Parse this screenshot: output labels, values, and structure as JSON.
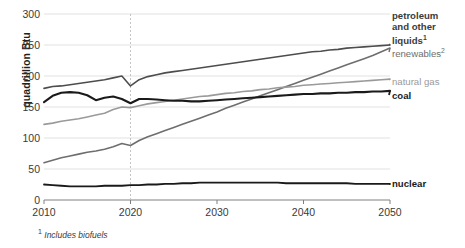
{
  "chart_data": {
    "type": "line",
    "title": "",
    "xlabel": "",
    "ylabel": "quadrillion Btu",
    "xlim": [
      2010,
      2050
    ],
    "ylim": [
      0,
      300
    ],
    "yticks": [
      0,
      50,
      100,
      150,
      200,
      250,
      300
    ],
    "xticks": [
      2010,
      2020,
      2030,
      2040,
      2050
    ],
    "grid": "horizontal",
    "legend_position": "right-inline-labels",
    "projection_divider_year": 2020,
    "footnote": "Includes biofuels",
    "footnote_marker": "1",
    "x": [
      2010,
      2011,
      2012,
      2013,
      2014,
      2015,
      2016,
      2017,
      2018,
      2019,
      2020,
      2021,
      2022,
      2023,
      2024,
      2025,
      2026,
      2027,
      2028,
      2029,
      2030,
      2031,
      2032,
      2033,
      2034,
      2035,
      2036,
      2037,
      2038,
      2039,
      2040,
      2041,
      2042,
      2043,
      2044,
      2045,
      2046,
      2047,
      2048,
      2049,
      2050
    ],
    "series": [
      {
        "name": "petroleum and other liquids",
        "label": "petroleum and other liquids",
        "label_marker": "1",
        "color": "#4d4d4d",
        "width": 1.6,
        "values": [
          180,
          183,
          184,
          186,
          188,
          190,
          192,
          194,
          197,
          200,
          184,
          194,
          199,
          202,
          205,
          207,
          209,
          211,
          213,
          215,
          217,
          219,
          221,
          223,
          225,
          227,
          229,
          231,
          233,
          235,
          237,
          239,
          240,
          242,
          243,
          245,
          246,
          247,
          248,
          249,
          250
        ]
      },
      {
        "name": "renewables",
        "label": "renewables",
        "label_marker": "2",
        "color": "#6e6e6e",
        "width": 1.6,
        "values": [
          60,
          64,
          68,
          71,
          74,
          77,
          79,
          82,
          86,
          91,
          88,
          96,
          102,
          107,
          112,
          117,
          122,
          127,
          132,
          137,
          142,
          148,
          153,
          158,
          163,
          168,
          173,
          178,
          183,
          188,
          193,
          198,
          203,
          208,
          213,
          218,
          223,
          228,
          233,
          239,
          245
        ]
      },
      {
        "name": "natural gas",
        "label": "natural gas",
        "color": "#9a9a9a",
        "width": 1.6,
        "values": [
          122,
          124,
          127,
          129,
          131,
          134,
          137,
          140,
          146,
          150,
          149,
          152,
          155,
          157,
          159,
          161,
          163,
          165,
          167,
          168,
          170,
          172,
          173,
          175,
          176,
          178,
          179,
          181,
          182,
          183,
          185,
          186,
          187,
          188,
          189,
          190,
          191,
          192,
          193,
          194,
          195
        ]
      },
      {
        "name": "coal",
        "label": "coal",
        "color": "#1a1a1a",
        "width": 2.1,
        "values": [
          158,
          168,
          173,
          174,
          173,
          169,
          161,
          165,
          167,
          163,
          156,
          163,
          163,
          162,
          161,
          160,
          160,
          159,
          159,
          160,
          161,
          162,
          163,
          164,
          165,
          166,
          167,
          168,
          169,
          170,
          171,
          171,
          172,
          172,
          173,
          173,
          174,
          174,
          175,
          175,
          176
        ]
      },
      {
        "name": "nuclear",
        "label": "nuclear",
        "color": "#1a1a1a",
        "width": 1.8,
        "values": [
          25,
          24,
          23,
          22,
          22,
          22,
          22,
          23,
          23,
          23,
          24,
          24,
          25,
          25,
          26,
          26,
          27,
          27,
          28,
          28,
          28,
          28,
          28,
          28,
          28,
          28,
          28,
          28,
          27,
          27,
          27,
          27,
          27,
          27,
          27,
          27,
          26,
          26,
          26,
          26,
          26
        ]
      }
    ]
  },
  "axis": {
    "ytick_labels": [
      "0",
      "50",
      "100",
      "150",
      "200",
      "250",
      "300"
    ],
    "xtick_labels": [
      "2010",
      "2020",
      "2030",
      "2040",
      "2050"
    ],
    "ylabel_text": "quadrillion Btu"
  },
  "annotations": {
    "petroleum_line1": "petroleum",
    "petroleum_line2": "and other",
    "petroleum_line3": "liquids",
    "petroleum_sup": "1",
    "renewables": "renewables",
    "renewables_sup": "2",
    "natural_gas": "natural gas",
    "coal": "coal",
    "nuclear": "nuclear"
  },
  "footnote": {
    "marker": "1",
    "text": "Includes biofuels"
  },
  "colors": {
    "petroleum": "#4d4d4d",
    "renewables": "#6e6e6e",
    "natural_gas": "#9a9a9a",
    "coal": "#1a1a1a",
    "nuclear": "#1a1a1a",
    "gridline": "#d9d9d9",
    "axis": "#808080",
    "divider": "#bdbdbd"
  }
}
